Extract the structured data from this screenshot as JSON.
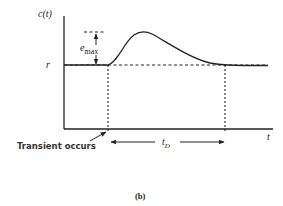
{
  "figure": {
    "caption": "(b)",
    "y_axis_label": "c(t)",
    "x_axis_label": "t",
    "baseline_label": "r",
    "peak_label": "e",
    "peak_label_sub": "max",
    "transient_label": "Transient occurs",
    "duration_label": "t",
    "duration_label_sub": "D",
    "colors": {
      "ink": "#222222",
      "background": "#ffffff"
    }
  }
}
